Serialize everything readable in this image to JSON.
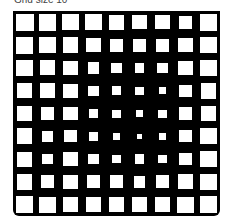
{
  "caption": "Grid size 10",
  "grid": {
    "rows": 9,
    "cols": 9,
    "background": "#000000",
    "cell_color": "#ffffff",
    "cell_scale": [
      [
        1.0,
        0.95,
        0.9,
        0.9,
        0.88,
        0.8,
        0.78,
        0.75,
        0.95
      ],
      [
        0.95,
        0.92,
        0.88,
        0.82,
        0.75,
        0.72,
        0.72,
        0.8,
        0.9
      ],
      [
        0.92,
        0.85,
        0.82,
        0.65,
        0.6,
        0.55,
        0.6,
        0.78,
        0.9
      ],
      [
        0.85,
        0.82,
        0.78,
        0.58,
        0.5,
        0.45,
        0.4,
        0.7,
        0.88
      ],
      [
        0.82,
        0.72,
        0.78,
        0.55,
        0.45,
        0.42,
        0.45,
        0.72,
        0.86
      ],
      [
        0.88,
        0.65,
        0.7,
        0.5,
        0.42,
        0.3,
        0.4,
        0.7,
        0.9
      ],
      [
        0.85,
        0.6,
        0.8,
        0.6,
        0.5,
        0.55,
        0.5,
        0.72,
        0.92
      ],
      [
        0.88,
        0.72,
        0.82,
        0.75,
        0.72,
        0.65,
        0.72,
        0.85,
        0.92
      ],
      [
        0.95,
        0.9,
        0.85,
        0.88,
        0.88,
        0.82,
        0.85,
        0.9,
        0.95
      ]
    ]
  }
}
